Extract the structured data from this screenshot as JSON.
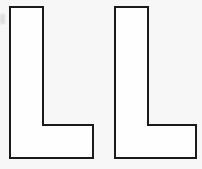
{
  "figure": {
    "background_color": "#f7f7f7",
    "canvas_width": 202,
    "canvas_height": 169,
    "shape_count": 2,
    "stroke_color": "#1a1a1a",
    "fill_color": "#fefefe",
    "stroke_width": 2
  },
  "shapes": [
    {
      "name": "left-l-shape",
      "label": "L",
      "points": "10,7 43,7 43,125 93,125 93,158 10,158",
      "bbox": {
        "x": 10,
        "y": 7,
        "width": 83,
        "height": 151
      },
      "stem_width": 33,
      "foot_height": 33,
      "foot_width": 83
    },
    {
      "name": "right-l-shape",
      "label": "L",
      "points": "115,7 148,7 148,125 196,125 196,158 115,158",
      "bbox": {
        "x": 115,
        "y": 7,
        "width": 81,
        "height": 151
      },
      "stem_width": 33,
      "foot_height": 33,
      "foot_width": 81
    }
  ],
  "artifacts": {
    "left_edge_smudge": "faint-gray-mark"
  }
}
